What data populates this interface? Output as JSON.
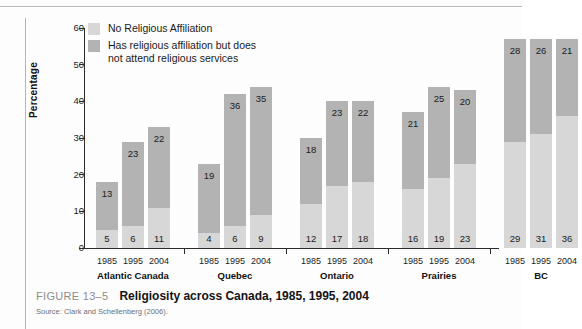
{
  "figure": {
    "number": "FIGURE 13–5",
    "title": "Religiosity across Canada, 1985, 1995, 2004",
    "source": "Source: Clark and Schellenberg (2006)."
  },
  "legend": {
    "items": [
      {
        "label": "No Religious Affiliation",
        "color": "#d7d7d7"
      },
      {
        "label": "Has religious affiliation but does\nnot attend religious services",
        "color": "#b3b3b3"
      }
    ]
  },
  "chart_data": {
    "type": "bar",
    "subtype": "stacked",
    "title": "Religiosity across Canada, 1985, 1995, 2004",
    "xlabel": "",
    "ylabel": "Percentage",
    "ylim": [
      0,
      60
    ],
    "yticks": [
      0,
      10,
      20,
      30,
      40,
      50,
      60
    ],
    "grid": false,
    "legend_position": "top-left",
    "groups": [
      "Atlantic Canada",
      "Quebec",
      "Ontario",
      "Prairies",
      "BC"
    ],
    "categories": [
      "1985",
      "1995",
      "2004",
      "1985",
      "1995",
      "2004",
      "1985",
      "1995",
      "2004",
      "1985",
      "1995",
      "2004",
      "1985",
      "1995",
      "2004"
    ],
    "series": [
      {
        "name": "No Religious Affiliation",
        "color": "#d7d7d7",
        "values": [
          5,
          6,
          11,
          4,
          6,
          9,
          12,
          17,
          18,
          16,
          19,
          23,
          29,
          31,
          36
        ]
      },
      {
        "name": "Has religious affiliation but does not attend religious services",
        "color": "#b3b3b3",
        "values": [
          13,
          23,
          22,
          19,
          36,
          35,
          18,
          23,
          22,
          21,
          25,
          20,
          28,
          26,
          21
        ]
      }
    ],
    "totals": [
      18,
      29,
      33,
      23,
      42,
      44,
      30,
      40,
      40,
      37,
      44,
      43,
      57,
      57,
      57
    ]
  }
}
